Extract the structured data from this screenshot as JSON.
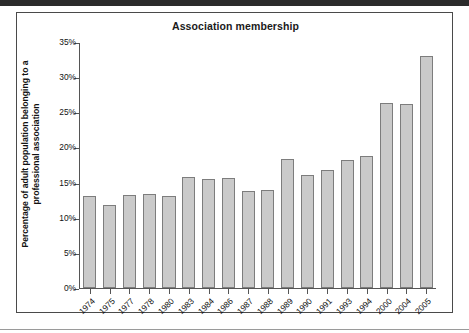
{
  "chart_data": {
    "type": "bar",
    "title": "Association membership",
    "xlabel": "",
    "ylabel": "Percentage of adult population belonging to a professional association",
    "ylim": [
      0,
      35
    ],
    "ytick_labels": [
      "0%",
      "5%",
      "10%",
      "15%",
      "20%",
      "25%",
      "30%",
      "35%"
    ],
    "ytick_values": [
      0,
      5,
      10,
      15,
      20,
      25,
      30,
      35
    ],
    "grid": false,
    "legend": "none",
    "categories": [
      "1974",
      "1975",
      "1977",
      "1978",
      "1980",
      "1983",
      "1984",
      "1986",
      "1987",
      "1988",
      "1989",
      "1990",
      "1991",
      "1993",
      "1994",
      "2000",
      "2004",
      "2005"
    ],
    "values": [
      13.2,
      11.9,
      13.3,
      13.4,
      13.2,
      15.8,
      15.6,
      15.7,
      13.9,
      14.0,
      18.5,
      16.1,
      16.8,
      18.3,
      18.9,
      26.4,
      26.3,
      33.2
    ],
    "bar_fill_color": "#cacaca",
    "bar_edge_color": "#7d7d7d",
    "axis_color": "#555555",
    "text_color": "#111111"
  }
}
